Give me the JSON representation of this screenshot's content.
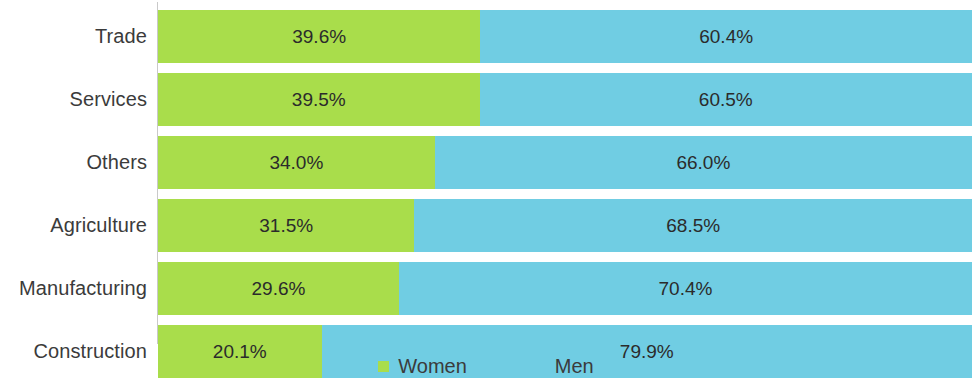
{
  "chart_data": {
    "type": "bar",
    "subtype": "stacked-horizontal-100-percent",
    "title": "",
    "subtitle": "",
    "xlabel": "",
    "ylabel": "",
    "xlim": [
      0,
      100
    ],
    "grid": false,
    "legend_position": "bottom-center",
    "categories": [
      "Trade",
      "Services",
      "Others",
      "Agriculture",
      "Manufacturing",
      "Construction"
    ],
    "series": [
      {
        "name": "Women",
        "color": "#a9dd4b",
        "values": [
          39.6,
          39.5,
          34.0,
          31.5,
          29.6,
          20.1
        ],
        "labels": [
          "39.6%",
          "39.5%",
          "34.0%",
          "31.5%",
          "29.6%",
          "20.1%"
        ]
      },
      {
        "name": "Men",
        "color": "#70cde3",
        "values": [
          60.4,
          60.5,
          66.0,
          68.5,
          70.4,
          79.9
        ],
        "labels": [
          "60.4%",
          "60.5%",
          "66.0%",
          "68.5%",
          "70.4%",
          "79.9%"
        ]
      }
    ]
  },
  "rows": [
    {
      "category": "Trade",
      "women_value": 39.6,
      "women_label": "39.6%",
      "men_value": 60.4,
      "men_label": "60.4%"
    },
    {
      "category": "Services",
      "women_value": 39.5,
      "women_label": "39.5%",
      "men_value": 60.5,
      "men_label": "60.5%"
    },
    {
      "category": "Others",
      "women_value": 34.0,
      "women_label": "34.0%",
      "men_value": 66.0,
      "men_label": "66.0%"
    },
    {
      "category": "Agriculture",
      "women_value": 31.5,
      "women_label": "31.5%",
      "men_value": 68.5,
      "men_label": "68.5%"
    },
    {
      "category": "Manufacturing",
      "women_value": 29.6,
      "women_label": "29.6%",
      "men_value": 70.4,
      "men_label": "70.4%"
    },
    {
      "category": "Construction",
      "women_value": 20.1,
      "women_label": "20.1%",
      "men_value": 79.9,
      "men_label": "79.9%"
    }
  ],
  "legend": {
    "items": [
      {
        "label": "Women",
        "color": "#a9dd4b",
        "swatch": "square-swatch-green"
      },
      {
        "label": "Men",
        "color": "#70cde3",
        "swatch": "square-swatch-blue"
      }
    ]
  },
  "colors": {
    "women": "#a9dd4b",
    "men": "#70cde3",
    "label_text": "#3b3b3b",
    "value_text": "#2b2b2b",
    "axis_line": "#c9c9c9",
    "background": "#ffffff"
  },
  "layout": {
    "bar_height_px": 53,
    "bar_gap_px": 10,
    "first_bar_top_px": 10,
    "plot_left_px": 158,
    "plot_width_px": 814,
    "label_right_px": 147
  }
}
